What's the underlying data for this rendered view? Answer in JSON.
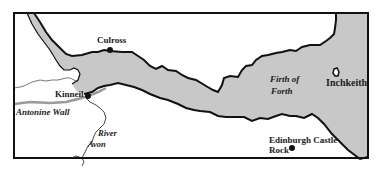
{
  "map": {
    "colors": {
      "water": "#c8c8c8",
      "land": "#ffffff",
      "coast": "#111111",
      "wall": "#9a9a9a",
      "river": "#333333",
      "frame": "#111111"
    },
    "places": [
      {
        "id": "culross",
        "label": "Culross"
      },
      {
        "id": "kinneil",
        "label": "Kinneil"
      },
      {
        "id": "edinburgh",
        "label_line1": "Edinburgh Castle",
        "label_line2": "Rock"
      },
      {
        "id": "inchkeith",
        "label": "Inchkeith"
      }
    ],
    "features": {
      "antonine_wall": "Antonine Wall",
      "river_line1": "River",
      "river_line2": "Avon",
      "firth_line1": "Firth of",
      "firth_line2": "Forth"
    }
  }
}
